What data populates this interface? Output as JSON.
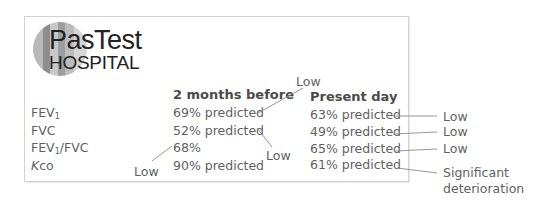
{
  "logo": {
    "line1": "PasTest",
    "line2": "HOSPITAL",
    "circle_colors": [
      "#b9b9b9",
      "#8e8e8e",
      "#c8c8c8",
      "#9d9d9d",
      "#bcbcbc",
      "#d5d5d5"
    ]
  },
  "table": {
    "columns": [
      "2 months before",
      "Present day"
    ],
    "rows": [
      {
        "label_main": "FEV",
        "label_sub": "1",
        "label_rest": "",
        "before": "69% predicted",
        "present": "63% predicted"
      },
      {
        "label_main": "FVC",
        "label_sub": "",
        "label_rest": "",
        "before": "52% predicted",
        "present": "49% predicted"
      },
      {
        "label_main": "FEV",
        "label_sub": "1",
        "label_rest": "/FVC",
        "before": "68%",
        "present": "65% predicted"
      },
      {
        "label_italic": "K",
        "label_main": "co",
        "label_sub": "",
        "label_rest": "",
        "before": "90% predicted",
        "present": "61% predicted"
      }
    ]
  },
  "annotations": {
    "before_fev1": "Low",
    "before_fvc": "Low",
    "before_ratio": "Low",
    "present_fev1": "Low",
    "present_fvc": "Low",
    "present_ratio": "Low",
    "present_kco_line1": "Significant",
    "present_kco_line2": "deterioration"
  },
  "colors": {
    "text": "#5f5f5f",
    "header": "#4a4a4a",
    "border": "#d2d2d2",
    "leader_line": "#8a8a8a"
  }
}
